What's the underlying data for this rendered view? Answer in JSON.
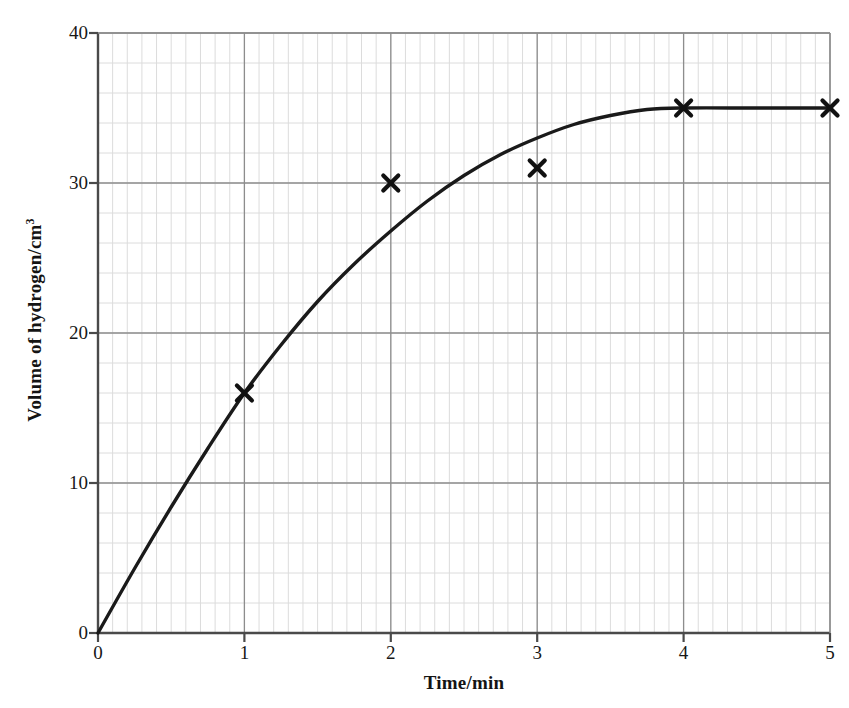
{
  "chart_data": {
    "type": "line",
    "title": "",
    "xlabel": "Time/min",
    "ylabel": "Volume of hydrogen/cm",
    "ylabel_superscript": "3",
    "xlim": [
      0,
      5
    ],
    "ylim": [
      0,
      40
    ],
    "x_ticks": [
      0,
      1,
      2,
      3,
      4,
      5
    ],
    "y_ticks": [
      0,
      10,
      20,
      30,
      40
    ],
    "x_tick_labels": [
      "0",
      "1",
      "2",
      "3",
      "4",
      "5"
    ],
    "y_tick_labels": [
      "0",
      "10",
      "20",
      "30",
      "40"
    ],
    "grid": true,
    "grid_major_step_x": 1,
    "grid_major_step_y": 10,
    "grid_minor_step_x": 0.1,
    "grid_minor_step_y": 2,
    "legend": "none",
    "series": [
      {
        "name": "plotted points",
        "marker": "x-cross",
        "line": "none",
        "x": [
          1,
          2,
          3,
          4,
          5
        ],
        "values": [
          16,
          30,
          31,
          35,
          35
        ]
      },
      {
        "name": "best-fit curve",
        "marker": "none",
        "line": "solid",
        "x": [
          0,
          0.25,
          0.5,
          0.75,
          1,
          1.25,
          1.5,
          1.75,
          2,
          2.25,
          2.5,
          2.75,
          3,
          3.25,
          3.5,
          3.75,
          4,
          4.5,
          5
        ],
        "values": [
          0,
          4.3,
          8.4,
          12.3,
          16.0,
          19.2,
          22.1,
          24.6,
          26.8,
          28.8,
          30.5,
          31.9,
          33.0,
          33.9,
          34.5,
          34.9,
          35.0,
          35.0,
          35.0
        ]
      }
    ],
    "colors": {
      "curve": "#1a1a1a",
      "marker": "#111111",
      "axis": "#4a4a4a",
      "grid_major": "#8d8d8d",
      "grid_minor": "#dcdcdc",
      "background": "#ffffff"
    }
  }
}
